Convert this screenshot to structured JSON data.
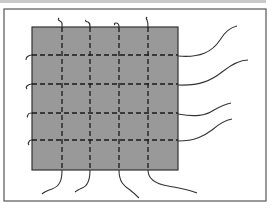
{
  "diagram": {
    "colors": {
      "background": "#ffffff",
      "topbar": "#c9c9c9",
      "frame_stroke": "#555555",
      "panel_fill": "#999999",
      "panel_stroke": "#333333",
      "grid_stroke": "#1a1a1a",
      "wire_stroke": "#333333"
    },
    "frame": {
      "x": 4,
      "y": 9,
      "w": 262,
      "h": 192
    },
    "panel": {
      "x": 32,
      "y": 27,
      "w": 146,
      "h": 143
    },
    "vertical_lines_x": [
      62,
      90,
      119,
      148
    ],
    "horizontal_lines_y": [
      55,
      84,
      113,
      140
    ],
    "wires": {
      "right": [
        "M178 56 C200 58 212 52 220 40 C226 30 232 27 237 26",
        "M178 85 C200 86 212 80 222 72 C232 64 240 60 248 60",
        "M178 114 C195 117 205 116 214 110 C221 106 226 104 231 103",
        "M178 141 C195 141 204 136 212 130 C220 123 226 120 232 119"
      ],
      "bottom": [
        "M62 170 C62 180 60 186 52 189 C46 191 43 193 42 194",
        "M90 170 C90 180 88 186 82 188 C78 190 76 191 75 192",
        "M119 170 C119 182 124 186 130 190 C134 193 137 196 139 198",
        "M148 170 C148 180 156 184 168 186 C180 188 190 190 197 193"
      ],
      "top": [
        "M62 27 C62 24 63 22 60 21 C58 20 58 19 59 18",
        "M90 27 C90 24 90 23 88 22 C86 22 85 21 86 20",
        "M119 27 C119 24 118 23 116 23 C114 23 114 24 115 25",
        "M148 27 C148 24 148 22 147 20 C146 19 146 18 147 17"
      ],
      "left": [
        "M32 55 C29 55 28 56 27 57 C26 58 26 59 26 60",
        "M32 84 C29 84 28 85 27 86 C26 87 26 88 27 89",
        "M32 113 C29 113 28 114 28 115 C27 116 27 117 28 117",
        "M32 140 C30 140 29 141 29 142 C28 143 28 144 29 145"
      ]
    }
  }
}
